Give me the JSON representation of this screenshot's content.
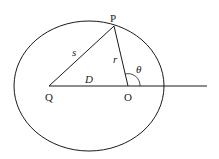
{
  "diagram": {
    "type": "geometry",
    "points": {
      "P": {
        "label": "P",
        "x": 114,
        "y": 26
      },
      "Q": {
        "label": "Q",
        "x": 49,
        "y": 86
      },
      "O": {
        "label": "O",
        "x": 128,
        "y": 86
      }
    },
    "segments": [
      {
        "from": "Q",
        "to": "P",
        "label": "s"
      },
      {
        "from": "O",
        "to": "P",
        "label": "r"
      },
      {
        "from": "Q",
        "to": "O",
        "label": "D"
      }
    ],
    "angle": {
      "label": "θ",
      "vertex": "O"
    },
    "ellipse": {
      "cx": 89,
      "cy": 86,
      "rx": 75,
      "ry": 65
    },
    "stroke_color": "#1a1a1a"
  }
}
